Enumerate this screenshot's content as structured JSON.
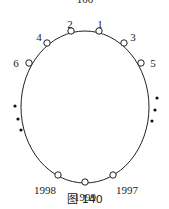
{
  "top_cropped_label": "100",
  "nodes": [
    {
      "id": "1",
      "label": "1"
    },
    {
      "id": "2",
      "label": "2"
    },
    {
      "id": "3",
      "label": "3"
    },
    {
      "id": "4",
      "label": "4"
    },
    {
      "id": "5",
      "label": "5"
    },
    {
      "id": "6",
      "label": "6"
    },
    {
      "id": "1997",
      "label": "1997"
    },
    {
      "id": "1998",
      "label": "1998"
    },
    {
      "id": "1999",
      "label": "1999"
    }
  ],
  "ellipsis_dots": [
    "left",
    "right"
  ],
  "caption": "图 140"
}
